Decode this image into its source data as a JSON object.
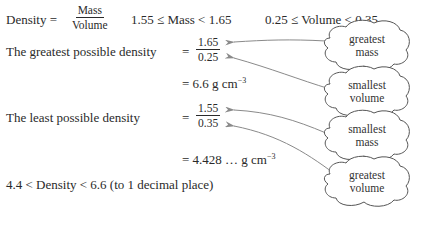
{
  "formula": {
    "lhs": "Density =",
    "numerator": "Mass",
    "denominator": "Volume",
    "mass_bounds": "1.55 ≤ Mass < 1.65",
    "volume_bounds": "0.25 ≤ Volume < 0.35"
  },
  "greatest": {
    "label": "The greatest possible density",
    "equals": "=",
    "numerator": "1.65",
    "denominator": "0.25",
    "result": "= 6.6 g cm",
    "result_exp": "−3"
  },
  "least": {
    "label": "The least possible density",
    "equals": "=",
    "numerator": "1.55",
    "denominator": "0.35",
    "result": "= 4.428 … g cm",
    "result_exp": "−3"
  },
  "conclusion": "4.4 < Density < 6.6 (to 1 decimal place)",
  "clouds": [
    {
      "line1": "greatest",
      "line2": "mass"
    },
    {
      "line1": "smallest",
      "line2": "volume"
    },
    {
      "line1": "smallest",
      "line2": "mass"
    },
    {
      "line1": "greatest",
      "line2": "volume"
    }
  ],
  "colors": {
    "text": "#2a2a2a",
    "arrow": "#8a8a8a",
    "cloud": "#555555"
  }
}
